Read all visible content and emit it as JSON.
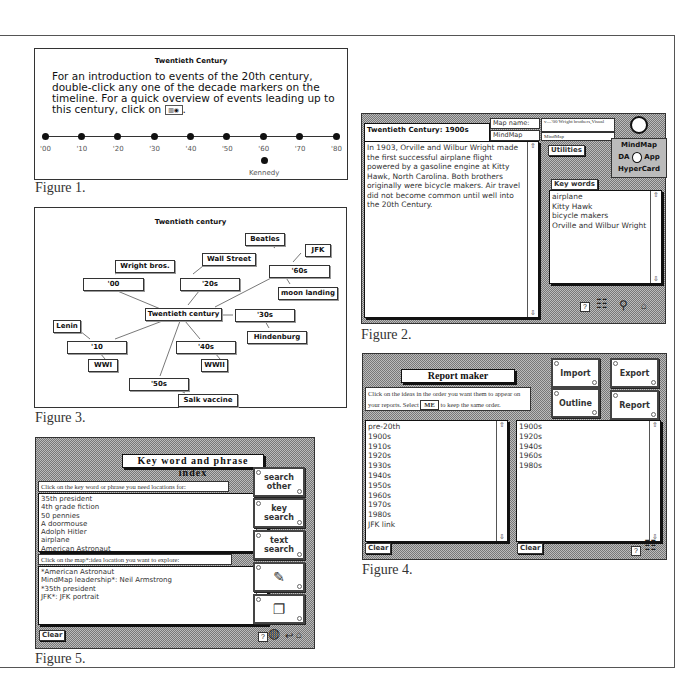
{
  "figure1": {
    "title": "Twentieth Century",
    "intro_text": "For an introduction to events of the 20th century, double-click any one of the decade markers on the timeline. For a quick overview of events leading up to this century, click on",
    "overview_icon": "overview-button-icon",
    "timeline_markers": [
      "'00",
      "'10",
      "'20",
      "'30",
      "'40",
      "'50",
      "'60",
      "'70",
      "'80"
    ],
    "sub_marker": {
      "label": "Kennedy",
      "under": "'60"
    },
    "caption": "Figure 1."
  },
  "figure2": {
    "title": "Twentieth Century: 1900s",
    "map_name_label": "Map name:",
    "map_name_value": "v—'00 Wright brothers,Visual",
    "mindmap_label": "MindMap",
    "mindmap_value": "MindMap",
    "body_text": "In 1903, Orville and Wilbur Wright made the first successful airplane flight powered by a gasoline engine at Kitty Hawk, North Carolina. Both brothers originally were bicycle makers. Air travel did not become common until well into the 20th Century.",
    "utilities_button": "Utilities",
    "app_switch": {
      "top": "MindMap",
      "left": "DA",
      "right": "App",
      "bottom": "HyperCard"
    },
    "keywords_label": "Key words",
    "keywords": [
      "airplane",
      "Kitty Hawk",
      "bicycle makers",
      "Orville and Wilbur Wright"
    ],
    "icons": [
      "help-icon",
      "map-icon",
      "magnifier-icon",
      "home-icon"
    ],
    "caption": "Figure 2."
  },
  "figure3": {
    "title": "Twentieth century",
    "center": "Twentieth century",
    "nodes": {
      "n00": "'00",
      "wright": "Wright bros.",
      "n10": "'10",
      "lenin": "Lenin",
      "ww1": "WWI",
      "n20": "'20s",
      "wallst": "Wall Street",
      "n30": "'30s",
      "hindenburg": "Hindenburg",
      "n40": "'40s",
      "ww2": "WWII",
      "n50": "'50s",
      "salk": "Salk vaccine",
      "n60": "'60s",
      "beatles": "Beatles",
      "jfk": "JFK",
      "moon": "moon landing"
    },
    "caption": "Figure 3."
  },
  "figure4": {
    "title": "Report maker",
    "instruction_part1": "Click on the  ideas in the order you want them to appear on your reports. Select",
    "me_button": "ME",
    "instruction_part2": "to keep the same order.",
    "buttons": {
      "import": "Import",
      "export": "Export",
      "outline": "Outline",
      "report": "Report"
    },
    "left_list": [
      "pre-20th",
      "1900s",
      "1910s",
      "1920s",
      "1930s",
      "1940s",
      "1950s",
      "1960s",
      "1970s",
      "1980s",
      "JFK link"
    ],
    "right_list": [
      "1900s",
      "1920s",
      "1940s",
      "1960s",
      "1980s"
    ],
    "clear_left": "Clear",
    "clear_right": "Clear",
    "caption": "Figure 4."
  },
  "figure5": {
    "title": "Key word and phrase index",
    "prompt1": "Click on the key word or phrase you need locations for:",
    "keywords": [
      "35th president",
      "4th grade fiction",
      "50 pennies",
      "A doormouse",
      "Adolph Hitler",
      "airplane",
      "American Astronaut"
    ],
    "prompt2": "Click on the map*:idea location you want to explore:",
    "locations": [
      "*American Astronaut",
      "MindMap leadership*: Neil Armstrong",
      "*35th president",
      "JFK*: JFK portrait"
    ],
    "buttons": {
      "search_other": "search other",
      "key_search": "key search",
      "text_search": "text search"
    },
    "clear": "Clear",
    "caption": "Figure 5."
  }
}
